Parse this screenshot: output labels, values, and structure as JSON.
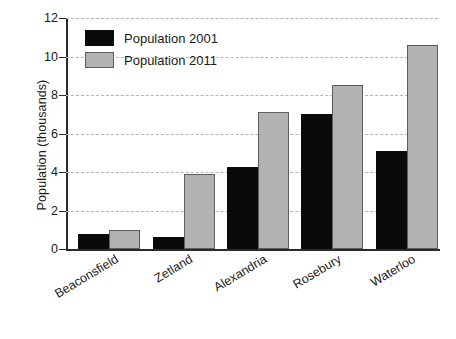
{
  "chart_data": {
    "type": "bar",
    "title": "",
    "xlabel": "",
    "ylabel": "Population (thousands)",
    "categories": [
      "Beaconsfield",
      "Zetland",
      "Alexandria",
      "Rosebury",
      "Waterloo"
    ],
    "series": [
      {
        "name": "Population 2001",
        "color": "#0a0a0a",
        "values": [
          0.8,
          0.6,
          4.25,
          7.0,
          5.1
        ]
      },
      {
        "name": "Population 2011",
        "color": "#b2b2b2",
        "values": [
          1.0,
          3.9,
          7.1,
          8.5,
          10.6
        ]
      }
    ],
    "ylim": [
      0,
      12
    ],
    "yticks": [
      0,
      2,
      4,
      6,
      8,
      10,
      12
    ],
    "ytick_labels": [
      "0",
      "2",
      "4",
      "6",
      "8",
      "10",
      "12"
    ],
    "grid": true,
    "grid_axis": "y",
    "legend_position": "upper left"
  },
  "legend": {
    "items": [
      {
        "label": "Population 2001"
      },
      {
        "label": "Population 2011"
      }
    ]
  }
}
